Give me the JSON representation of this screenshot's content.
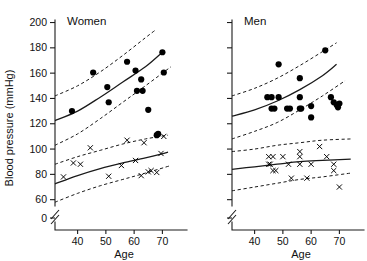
{
  "figure": {
    "background": "#ffffff",
    "ink": "#111111"
  },
  "axes": {
    "y_label": "Blood pressure (mmHg)",
    "x_label": "Age",
    "y_ticks": [
      0,
      60,
      80,
      100,
      120,
      140,
      160,
      180,
      200
    ],
    "y_tick_labels": [
      "0",
      "60",
      "80",
      "100",
      "120",
      "140",
      "160",
      "180",
      "200"
    ],
    "x_ticks": [
      40,
      50,
      60,
      70
    ],
    "x_tick_labels": [
      "40",
      "50",
      "60",
      "70"
    ],
    "y_break": true,
    "y_break_between": [
      0,
      60
    ],
    "x_range": [
      32,
      78
    ],
    "y_range": [
      55,
      202
    ]
  },
  "chart_data": {
    "type": "scatter",
    "title": "",
    "xlabel": "Age",
    "ylabel": "Blood pressure (mmHg)",
    "xlim": [
      32,
      78
    ],
    "ylim": [
      55,
      202
    ],
    "grid": false,
    "legend_position": "none",
    "axis_break_y": [
      0,
      60
    ],
    "panels": [
      {
        "id": "women",
        "label": "Women",
        "series": [
          {
            "name": "Systolic blood pressure",
            "marker": "filled-circle",
            "x": [
              38,
              45.5,
              50.5,
              51,
              57.5,
              60.5,
              61,
              62.5,
              63,
              65,
              68,
              68.5,
              70,
              70.5
            ],
            "y": [
              130,
              160.5,
              149,
              137,
              169,
              162,
              146,
              155,
              146,
              131,
              111,
              112,
              176.5,
              160.5
            ]
          },
          {
            "name": "Diastolic blood pressure",
            "marker": "x",
            "x": [
              35,
              38.5,
              41,
              44.5,
              51,
              55.5,
              57.5,
              60.5,
              62.5,
              63.5,
              65,
              66,
              68,
              69.5,
              70.5
            ],
            "y": [
              78,
              89,
              88,
              101,
              78.5,
              87,
              107,
              91,
              79,
              105,
              82,
              83,
              81.5,
              96.5,
              110
            ]
          }
        ],
        "curves": [
          {
            "name": "systolic-fit",
            "style": "solid",
            "points": [
              [
                32,
                122.5
              ],
              [
                40,
                130
              ],
              [
                48,
                141
              ],
              [
                56,
                153
              ],
              [
                64,
                165
              ],
              [
                70,
                176.5
              ]
            ]
          },
          {
            "name": "systolic-upper-ci",
            "style": "dashed",
            "points": [
              [
                32,
                142
              ],
              [
                40,
                150
              ],
              [
                48,
                161
              ],
              [
                56,
                174
              ],
              [
                64,
                188
              ],
              [
                67.5,
                194
              ]
            ]
          },
          {
            "name": "systolic-lower-ci",
            "style": "dashed",
            "points": [
              [
                32,
                103
              ],
              [
                40,
                112
              ],
              [
                48,
                124
              ],
              [
                56,
                137
              ],
              [
                64,
                150
              ],
              [
                73,
                165
              ]
            ]
          },
          {
            "name": "diastolic-fit",
            "style": "solid",
            "points": [
              [
                32,
                72.5
              ],
              [
                40,
                79
              ],
              [
                48,
                84.5
              ],
              [
                56,
                89
              ],
              [
                64,
                93
              ],
              [
                72,
                97.5
              ]
            ]
          },
          {
            "name": "diastolic-upper-ci",
            "style": "dashed",
            "points": [
              [
                32,
                88
              ],
              [
                40,
                94
              ],
              [
                48,
                99
              ],
              [
                56,
                104
              ],
              [
                64,
                108
              ],
              [
                72,
                111
              ]
            ]
          },
          {
            "name": "diastolic-lower-ci",
            "style": "dashed",
            "points": [
              [
                32,
                58
              ],
              [
                40,
                65
              ],
              [
                48,
                71
              ],
              [
                56,
                76
              ],
              [
                64,
                81
              ],
              [
                73,
                87
              ]
            ]
          }
        ]
      },
      {
        "id": "men",
        "label": "Men",
        "series": [
          {
            "name": "Systolic blood pressure",
            "marker": "filled-circle",
            "x": [
              44.5,
              46,
              48.5,
              48.5,
              46,
              47,
              51.5,
              52.5,
              56,
              56,
              56,
              56.5,
              60,
              60,
              65,
              67,
              68,
              69,
              69.5,
              70
            ],
            "y": [
              141,
              141,
              141,
              167,
              132,
              132,
              132,
              132,
              156,
              141,
              132,
              132,
              134,
              125,
              178,
              141,
              137,
              135,
              133,
              136
            ]
          },
          {
            "name": "Diastolic blood pressure",
            "marker": "x",
            "x": [
              45,
              45,
              45.5,
              46.5,
              46.5,
              47.5,
              50,
              52,
              53,
              56,
              56,
              56,
              58.5,
              60,
              63,
              65.5,
              68,
              68,
              70
            ],
            "y": [
              94,
              88,
              88,
              94,
              83,
              83,
              94,
              88,
              77,
              98,
              94,
              88,
              77,
              88,
              102,
              94,
              88,
              83,
              70
            ]
          }
        ],
        "curves": [
          {
            "name": "systolic-fit",
            "style": "solid",
            "points": [
              [
                32,
                126
              ],
              [
                40,
                131
              ],
              [
                48,
                138
              ],
              [
                56,
                147
              ],
              [
                64,
                158
              ],
              [
                69,
                167
              ]
            ]
          },
          {
            "name": "systolic-upper-ci",
            "style": "dashed",
            "points": [
              [
                32,
                142
              ],
              [
                40,
                148
              ],
              [
                48,
                156
              ],
              [
                56,
                166
              ],
              [
                64,
                177
              ],
              [
                69,
                184
              ]
            ]
          },
          {
            "name": "systolic-lower-ci",
            "style": "dashed",
            "points": [
              [
                32,
                108
              ],
              [
                40,
                114
              ],
              [
                48,
                121
              ],
              [
                56,
                131
              ],
              [
                64,
                142
              ],
              [
                72,
                154
              ]
            ]
          },
          {
            "name": "diastolic-fit",
            "style": "solid",
            "points": [
              [
                32,
                84
              ],
              [
                40,
                86
              ],
              [
                48,
                88
              ],
              [
                56,
                90
              ],
              [
                64,
                91
              ],
              [
                74,
                92
              ]
            ]
          },
          {
            "name": "diastolic-upper-ci",
            "style": "dashed",
            "points": [
              [
                32,
                98
              ],
              [
                40,
                100
              ],
              [
                48,
                103
              ],
              [
                56,
                105
              ],
              [
                64,
                107
              ],
              [
                74,
                108
              ]
            ]
          },
          {
            "name": "diastolic-lower-ci",
            "style": "dashed",
            "points": [
              [
                32,
                67
              ],
              [
                40,
                70
              ],
              [
                48,
                73
              ],
              [
                56,
                76
              ],
              [
                64,
                78
              ],
              [
                74,
                81
              ]
            ]
          }
        ]
      }
    ]
  }
}
